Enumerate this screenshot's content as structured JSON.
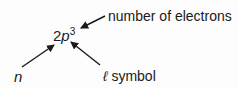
{
  "diagram": {
    "notation": {
      "n_value": "2",
      "l_letter": "p",
      "electrons": "3"
    },
    "labels": {
      "electrons": "number of electrons",
      "n": "n",
      "l_symbol_glyph": "ℓ",
      "l_symbol_text": "symbol"
    },
    "colors": {
      "text": "#1a1a1a",
      "arrow": "#1a1a1a",
      "background": "#fdfdfd"
    }
  }
}
